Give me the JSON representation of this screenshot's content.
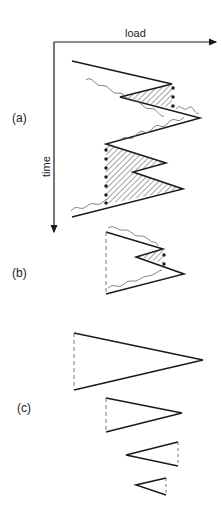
{
  "figure": {
    "axes": {
      "x_label": "load",
      "y_label": "time"
    },
    "panels": [
      {
        "id": "a",
        "label": "(a)"
      },
      {
        "id": "b",
        "label": "(b)"
      },
      {
        "id": "c",
        "label": "(c)"
      }
    ],
    "colors": {
      "line": "#1a1a1a",
      "hatch": "#333333",
      "background": "#ffffff"
    }
  }
}
